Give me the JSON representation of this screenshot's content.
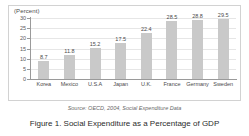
{
  "chart_data": {
    "type": "bar",
    "title": "",
    "axis_unit_label": "(Percent)",
    "categories": [
      "Korea",
      "Mexico",
      "U.S.A",
      "Japan",
      "U.K.",
      "France",
      "Germany",
      "Sweden"
    ],
    "values": [
      8.7,
      11.8,
      15.2,
      17.5,
      22.4,
      28.5,
      28.8,
      29.5
    ],
    "value_labels": [
      "8.7",
      "11.8",
      "15.2",
      "17.5",
      "22.4",
      "28.5",
      "28.8",
      "29.5"
    ],
    "xlabel": "",
    "ylabel": "(Percent)",
    "ylim": [
      0,
      30
    ],
    "yticks": [
      0,
      5,
      10,
      15,
      20,
      25,
      30
    ],
    "ytick_labels": [
      "0",
      "5",
      "10",
      "15",
      "20",
      "25",
      "30"
    ],
    "grid": true,
    "legend": false,
    "bar_color": "#c9c9c9",
    "grid_color": "#e6e6e6",
    "axis_color": "#9a9a9a"
  },
  "source_note": "Source: OECD, 2004, Social Expenditure Data",
  "caption": "Figure 1. Social Expenditure as a Percentage of GDP"
}
